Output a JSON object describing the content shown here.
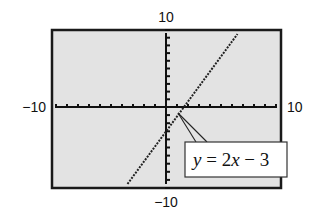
{
  "chart_data": {
    "type": "line",
    "title": "",
    "xlabel": "",
    "ylabel": "",
    "xlim": [
      -10,
      10
    ],
    "ylim": [
      -10,
      10
    ],
    "xscale": 1,
    "yscale": 1,
    "grid": false,
    "series": [
      {
        "name": "y = 2x − 3",
        "equation": "y = 2x - 3",
        "slope": 2,
        "intercept": -3,
        "style": "dotted",
        "x": [
          -3.5,
          6.5
        ],
        "y": [
          -10,
          10
        ]
      }
    ],
    "window_labels": {
      "ymax": "10",
      "ymin": "−10",
      "xmin": "−10",
      "xmax": "10"
    },
    "annotation": {
      "text_y": "y",
      "text_eq": " = 2",
      "text_x": "x",
      "text_rest": " − 3",
      "points_to": [
        1,
        -1
      ]
    }
  },
  "colors": {
    "screen_bg": "#e3e3e3",
    "frame": "#1a1a1a",
    "axis": "#111111",
    "line": "#222222",
    "label_box": "#ffffff"
  }
}
